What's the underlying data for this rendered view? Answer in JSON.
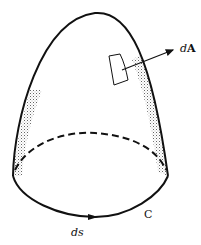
{
  "figure": {
    "labels": {
      "area_element_d": "d",
      "area_element_A": "A",
      "boundary_curve": "C",
      "line_element": "ds"
    },
    "colors": {
      "stroke": "#111111",
      "stipple": "#555555",
      "background": "#ffffff"
    }
  }
}
